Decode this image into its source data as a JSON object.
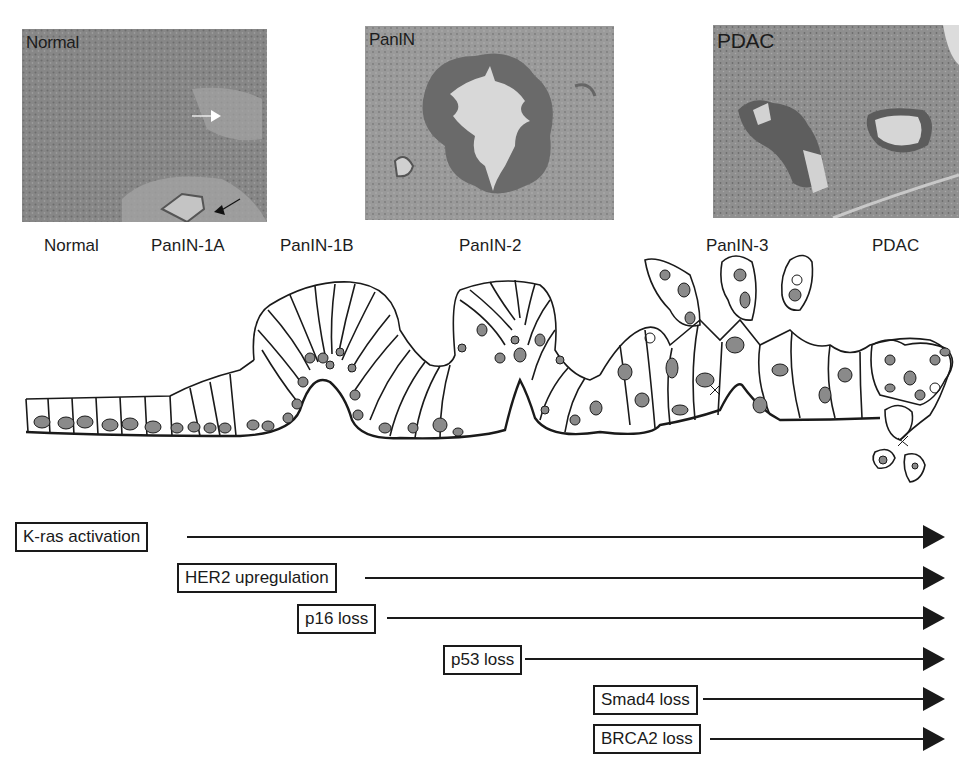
{
  "micrographs": [
    {
      "id": "normal",
      "label": "Normal"
    },
    {
      "id": "panin",
      "label": "PanIN"
    },
    {
      "id": "pdac",
      "label": "PDAC"
    }
  ],
  "stages": [
    {
      "label": "Normal"
    },
    {
      "label": "PanIN-1A"
    },
    {
      "label": "PanIN-1B"
    },
    {
      "label": "PanIN-2"
    },
    {
      "label": "PanIN-3"
    },
    {
      "label": "PDAC"
    }
  ],
  "markers": [
    {
      "label": "K-ras activation"
    },
    {
      "label": "HER2 upregulation"
    },
    {
      "label": "p16 loss"
    },
    {
      "label": "p53 loss"
    },
    {
      "label": "Smad4 loss"
    },
    {
      "label": "BRCA2 loss"
    }
  ],
  "colors": {
    "line": "#1a1a1a",
    "nucleus": "#8a8a8a",
    "tissue": "#8d8d8d",
    "lumen": "#d6d6d6"
  }
}
